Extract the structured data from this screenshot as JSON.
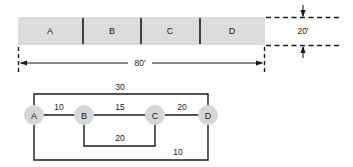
{
  "figure": {
    "beam": {
      "segments": [
        {
          "label": "A"
        },
        {
          "label": "B"
        },
        {
          "label": "C"
        },
        {
          "label": "D"
        }
      ],
      "overall_length_label": "80'",
      "depth_label": "20'"
    },
    "network": {
      "nodes": [
        {
          "label": "A"
        },
        {
          "label": "B"
        },
        {
          "label": "C"
        },
        {
          "label": "D"
        }
      ],
      "edges": [
        {
          "from": "A",
          "to": "B",
          "weight": "10"
        },
        {
          "from": "B",
          "to": "C",
          "weight": "15"
        },
        {
          "from": "C",
          "to": "D",
          "weight": "20"
        },
        {
          "from": "A",
          "to": "D",
          "weight": "30"
        },
        {
          "from": "B",
          "to": "C",
          "weight": "20"
        },
        {
          "from": "A",
          "to": "D",
          "weight": "10"
        }
      ]
    },
    "colors": {
      "beam_fill": "#dcdcdc",
      "node_fill": "#d6d6d6",
      "line": "#1a1a1a"
    }
  }
}
